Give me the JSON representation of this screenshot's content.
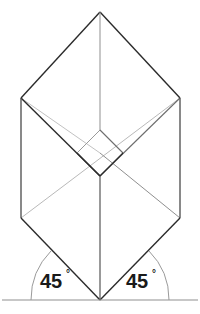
{
  "figure": {
    "title": "Isometric double-diamond construction with 45 degree base angles",
    "canvas": {
      "width": 200,
      "height": 314,
      "background": "#ffffff"
    },
    "colors": {
      "outline_dark": "#2b2b2b",
      "construction_light": "#b9b9b9",
      "construction_mid": "#8f8f8f",
      "baseline": "#8f8f8f",
      "arc": "#9a9a9a",
      "label_text": "#1a1a1a"
    },
    "points": {
      "top_apex": {
        "x": 100,
        "y": 12
      },
      "left_upper": {
        "x": 21,
        "y": 98
      },
      "right_upper": {
        "x": 180,
        "y": 98
      },
      "left_lower": {
        "x": 21,
        "y": 218
      },
      "right_lower": {
        "x": 180,
        "y": 218
      },
      "bottom_apex": {
        "x": 100,
        "y": 300
      },
      "center_top": {
        "x": 100,
        "y": 130
      },
      "center_bottom": {
        "x": 100,
        "y": 176
      },
      "center_left": {
        "x": 77,
        "y": 153
      },
      "center_right": {
        "x": 123,
        "y": 153
      }
    },
    "baseline": {
      "y": 300,
      "x_start": 2,
      "x_end": 198
    },
    "arcs": [
      {
        "name": "left-angle-arc",
        "radius": 69
      },
      {
        "name": "right-angle-arc",
        "radius": 69
      }
    ],
    "labels": {
      "left_angle": {
        "value": "45",
        "degree_symbol": "°"
      },
      "right_angle": {
        "value": "45",
        "degree_symbol": "°"
      }
    }
  }
}
